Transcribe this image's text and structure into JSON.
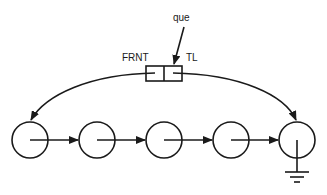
{
  "diagram": {
    "labels": {
      "queue_pointer": "que",
      "front": "FRNT",
      "tail": "TL"
    },
    "header_box": {
      "x": 146,
      "y": 66,
      "w": 36,
      "h": 15,
      "divider_x": 164
    },
    "nodes": [
      {
        "id": "node-1",
        "cx": 30,
        "cy": 140,
        "r": 18
      },
      {
        "id": "node-2",
        "cx": 97,
        "cy": 140,
        "r": 18
      },
      {
        "id": "node-3",
        "cx": 164,
        "cy": 140,
        "r": 18
      },
      {
        "id": "node-4",
        "cx": 231,
        "cy": 140,
        "r": 18
      },
      {
        "id": "node-5",
        "cx": 297,
        "cy": 140,
        "r": 18,
        "null_terminated": true
      }
    ],
    "edge_count": 4,
    "stroke_color": "#1a1a1a",
    "background": "#ffffff"
  }
}
